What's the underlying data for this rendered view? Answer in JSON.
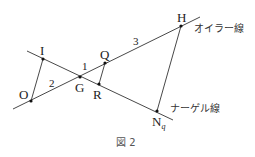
{
  "figure": {
    "caption": "図 2",
    "lines": {
      "euler": {
        "label": "オイラー線"
      },
      "nagel": {
        "label": "ナーゲル線"
      }
    },
    "points": {
      "O": {
        "label": "O"
      },
      "I": {
        "label": "I"
      },
      "G": {
        "label": "G"
      },
      "Q": {
        "label": "Q"
      },
      "R": {
        "label": "R"
      },
      "H": {
        "label": "H"
      },
      "N": {
        "label": "N",
        "subscript": "q"
      }
    },
    "ratios": {
      "OG": "2",
      "GQ": "1",
      "QH": "3"
    }
  }
}
